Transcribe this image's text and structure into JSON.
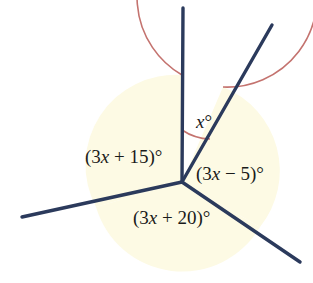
{
  "diagram": {
    "type": "geometry-angle-diagram",
    "colors": {
      "ray": "#2B3A5C",
      "arc": "#C4736F",
      "sector_fill": "#FDFAE4",
      "background": "#FFFFFF",
      "label_text": "#1A1A1A"
    },
    "vertex": {
      "x": 182,
      "y": 182
    },
    "circle": {
      "cx": 182,
      "cy": 165,
      "r": 90
    },
    "rays": [
      {
        "name": "ray-up",
        "angle_deg": 90,
        "tip_x": 183,
        "tip_y": 8
      },
      {
        "name": "ray-upper-right",
        "angle_deg": 63,
        "tip_x": 272,
        "tip_y": 25
      },
      {
        "name": "ray-lower-left",
        "angle_deg": 196,
        "tip_x": 22,
        "tip_y": 217
      },
      {
        "name": "ray-lower-right",
        "angle_deg": 330,
        "tip_x": 300,
        "tip_y": 262
      }
    ],
    "sectors": [
      {
        "name": "sector-x",
        "filled": false,
        "label": "x°"
      },
      {
        "name": "sector-3x-minus-5",
        "filled": true,
        "label": "(3x − 5)°"
      },
      {
        "name": "sector-3x-plus-20",
        "filled": true,
        "label": "(3x + 20)°"
      },
      {
        "name": "sector-3x-plus-15",
        "filled": true,
        "label": "(3x + 15)°"
      }
    ],
    "labels": {
      "x_angle": {
        "text": "x°",
        "var": "x",
        "suffix": "°",
        "x": 196,
        "y": 128
      },
      "left_angle": {
        "text": "(3x + 15)°",
        "prefix": "(3",
        "var": "x",
        "suffix": " + 15)°",
        "x": 85,
        "y": 163
      },
      "right_angle": {
        "text": "(3x − 5)°",
        "prefix": "(3",
        "var": "x",
        "suffix": " − 5)°",
        "x": 196,
        "y": 180
      },
      "bottom_angle": {
        "text": "(3x + 20)°",
        "prefix": "(3",
        "var": "x",
        "suffix": " + 20)°",
        "x": 133,
        "y": 224
      }
    }
  }
}
